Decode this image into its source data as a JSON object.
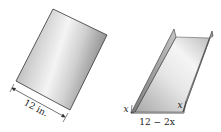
{
  "figure": {
    "sheet": {
      "description": "Flat rectangular metal sheet",
      "width_label": "12 in."
    },
    "gutter": {
      "description": "Sheet folded into an open rectangular gutter",
      "side_label_left": "x",
      "side_label_right": "x",
      "base_label": "12 − 2x"
    }
  },
  "colors": {
    "outline": "#333333",
    "metal_light": "#f2f2f2",
    "metal_mid": "#c9c9c9",
    "metal_dark": "#8a8a8a"
  }
}
